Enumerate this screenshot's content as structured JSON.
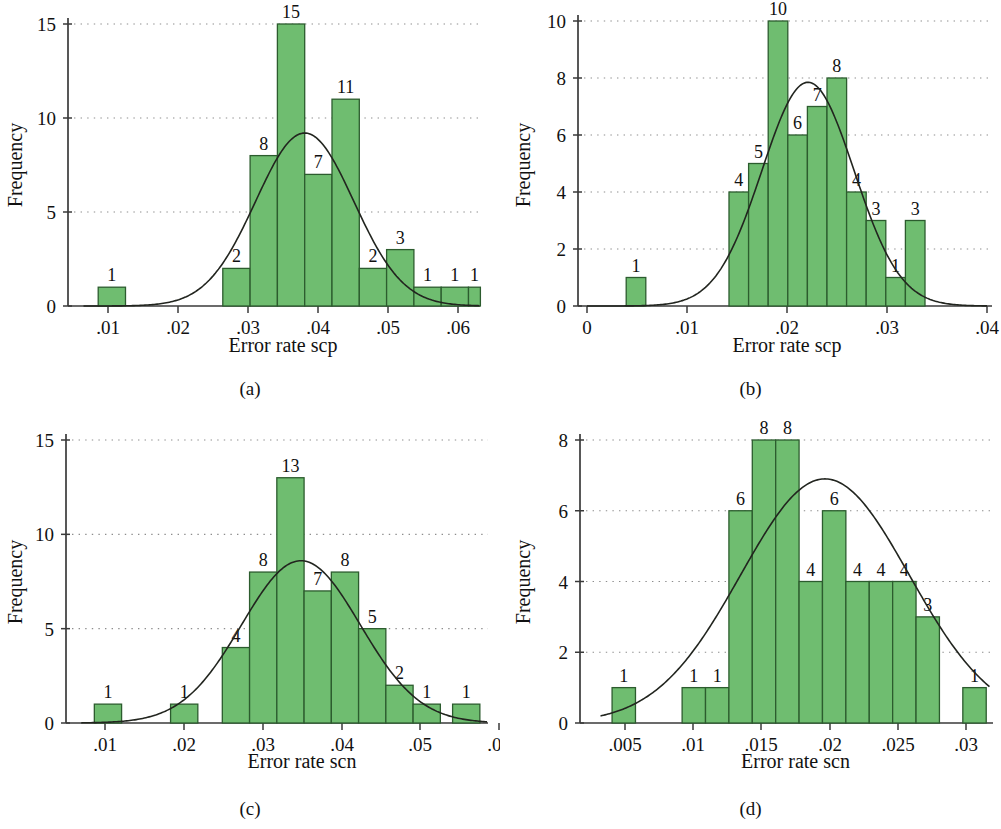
{
  "figure": {
    "panels": [
      {
        "id": "a",
        "caption": "(a)",
        "chart_data": {
          "type": "bar",
          "title": "",
          "xlabel": "Error rate scp",
          "ylabel": "Frequency",
          "xlim": [
            0.0065,
            0.0635
          ],
          "ylim": [
            0,
            16
          ],
          "xticks": [
            0.01,
            0.02,
            0.03,
            0.04,
            0.05,
            0.06
          ],
          "xticklabels": [
            ".01",
            ".02",
            ".03",
            ".04",
            ".05",
            ".06"
          ],
          "yticks": [
            0,
            5,
            10,
            15
          ],
          "yticklabels": [
            "0",
            "5",
            "10",
            "15"
          ],
          "grid": "horizontal-dotted",
          "bin_width": 0.0039,
          "bin_starts": [
            0.0086,
            0.0264,
            0.0303,
            0.0342,
            0.0381,
            0.042,
            0.0459,
            0.0498,
            0.0537,
            0.0576
          ],
          "values": [
            1,
            2,
            8,
            15,
            7,
            11,
            2,
            3,
            1,
            1,
            1
          ],
          "bars": [
            {
              "start": 0.0086,
              "end": 0.0125,
              "value": 1,
              "label": "1"
            },
            {
              "start": 0.0264,
              "end": 0.0303,
              "value": 2,
              "label": "2"
            },
            {
              "start": 0.0303,
              "end": 0.0342,
              "value": 8,
              "label": "8"
            },
            {
              "start": 0.0342,
              "end": 0.0381,
              "value": 15,
              "label": "15"
            },
            {
              "start": 0.0381,
              "end": 0.042,
              "value": 7,
              "label": "7"
            },
            {
              "start": 0.042,
              "end": 0.0459,
              "value": 11,
              "label": "11"
            },
            {
              "start": 0.0459,
              "end": 0.0498,
              "value": 2,
              "label": "2"
            },
            {
              "start": 0.0498,
              "end": 0.0537,
              "value": 3,
              "label": "3"
            },
            {
              "start": 0.0537,
              "end": 0.0576,
              "value": 1,
              "label": "1"
            },
            {
              "start": 0.0576,
              "end": 0.0615,
              "value": 1,
              "label": "1"
            },
            {
              "start": 0.0615,
              "end": 0.0632,
              "value": 1,
              "label": "1"
            }
          ],
          "normal_curve": {
            "mean": 0.0381,
            "sd": 0.007,
            "peak_height": 9.2
          }
        }
      },
      {
        "id": "b",
        "caption": "(b)",
        "chart_data": {
          "type": "bar",
          "title": "",
          "xlabel": "Error rate scp",
          "ylabel": "Frequency",
          "xlim": [
            0.0,
            0.04
          ],
          "ylim": [
            0,
            10.6
          ],
          "xticks": [
            0,
            0.01,
            0.02,
            0.03,
            0.04
          ],
          "xticklabels": [
            "0",
            ".01",
            ".02",
            ".03",
            ".04"
          ],
          "yticks": [
            0,
            2,
            4,
            6,
            8,
            10
          ],
          "yticklabels": [
            "0",
            "2",
            "4",
            "6",
            "8",
            "10"
          ],
          "grid": "horizontal-dotted",
          "bin_width": 0.00196,
          "values": [
            1,
            4,
            5,
            10,
            6,
            7,
            8,
            4,
            3,
            1,
            3
          ],
          "bars": [
            {
              "start": 0.00392,
              "end": 0.00588,
              "value": 1,
              "label": "1"
            },
            {
              "start": 0.0142,
              "end": 0.01616,
              "value": 4,
              "label": "4"
            },
            {
              "start": 0.01616,
              "end": 0.01812,
              "value": 5,
              "label": "5"
            },
            {
              "start": 0.01812,
              "end": 0.02008,
              "value": 10,
              "label": "10"
            },
            {
              "start": 0.02008,
              "end": 0.02204,
              "value": 6,
              "label": "6"
            },
            {
              "start": 0.02204,
              "end": 0.024,
              "value": 7,
              "label": "7"
            },
            {
              "start": 0.024,
              "end": 0.02596,
              "value": 8,
              "label": "8"
            },
            {
              "start": 0.02596,
              "end": 0.02792,
              "value": 4,
              "label": "4"
            },
            {
              "start": 0.02792,
              "end": 0.02988,
              "value": 3,
              "label": "3"
            },
            {
              "start": 0.02988,
              "end": 0.03184,
              "value": 1,
              "label": "1"
            },
            {
              "start": 0.03184,
              "end": 0.0338,
              "value": 3,
              "label": "3"
            }
          ],
          "normal_curve": {
            "mean": 0.0221,
            "sd": 0.0046,
            "peak_height": 7.85
          }
        }
      },
      {
        "id": "c",
        "caption": "(c)",
        "chart_data": {
          "type": "bar",
          "title": "",
          "xlabel": "Error rate scn",
          "ylabel": "Frequency",
          "xlim": [
            0.007,
            0.0602
          ],
          "ylim": [
            0,
            16
          ],
          "xticks": [
            0.01,
            0.02,
            0.03,
            0.04,
            0.05,
            0.06
          ],
          "xticklabels": [
            ".01",
            ".02",
            ".03",
            ".04",
            ".05",
            ".06"
          ],
          "yticks": [
            0,
            5,
            10,
            15
          ],
          "yticklabels": [
            "0",
            "5",
            "10",
            "15"
          ],
          "grid": "horizontal-dotted",
          "bin_width": 0.00345,
          "values": [
            1,
            1,
            4,
            8,
            13,
            7,
            8,
            5,
            2,
            1,
            1
          ],
          "bars": [
            {
              "start": 0.00865,
              "end": 0.0121,
              "value": 1,
              "label": "1"
            },
            {
              "start": 0.0183,
              "end": 0.02175,
              "value": 1,
              "label": "1"
            },
            {
              "start": 0.02485,
              "end": 0.0283,
              "value": 4,
              "label": "4"
            },
            {
              "start": 0.0283,
              "end": 0.03175,
              "value": 8,
              "label": "8"
            },
            {
              "start": 0.03175,
              "end": 0.0352,
              "value": 13,
              "label": "13"
            },
            {
              "start": 0.0352,
              "end": 0.03865,
              "value": 7,
              "label": "7"
            },
            {
              "start": 0.03865,
              "end": 0.0421,
              "value": 8,
              "label": "8"
            },
            {
              "start": 0.0421,
              "end": 0.04555,
              "value": 5,
              "label": "5"
            },
            {
              "start": 0.04555,
              "end": 0.049,
              "value": 2,
              "label": "2"
            },
            {
              "start": 0.049,
              "end": 0.05245,
              "value": 1,
              "label": "1"
            },
            {
              "start": 0.054,
              "end": 0.05745,
              "value": 1,
              "label": "1"
            }
          ],
          "normal_curve": {
            "mean": 0.0348,
            "sd": 0.0075,
            "peak_height": 8.6
          }
        }
      },
      {
        "id": "d",
        "caption": "(d)",
        "chart_data": {
          "type": "bar",
          "title": "",
          "xlabel": "Error rate scn",
          "ylabel": "Frequency",
          "xlim": [
            0.0032,
            0.0318
          ],
          "ylim": [
            0,
            8.6
          ],
          "xticks": [
            0.005,
            0.01,
            0.015,
            0.02,
            0.025,
            0.03
          ],
          "xticklabels": [
            ".005",
            ".01",
            ".015",
            ".02",
            ".025",
            ".03"
          ],
          "yticks": [
            0,
            2,
            4,
            6,
            8
          ],
          "yticklabels": [
            "0",
            "2",
            "4",
            "6",
            "8"
          ],
          "grid": "horizontal-dotted",
          "bin_width": 0.00172,
          "values": [
            1,
            1,
            1,
            6,
            8,
            8,
            4,
            6,
            4,
            4,
            4,
            3,
            1
          ],
          "bars": [
            {
              "start": 0.00405,
              "end": 0.00577,
              "value": 1,
              "label": "1"
            },
            {
              "start": 0.0092,
              "end": 0.01092,
              "value": 1,
              "label": "1"
            },
            {
              "start": 0.01092,
              "end": 0.01264,
              "value": 1,
              "label": "1"
            },
            {
              "start": 0.01264,
              "end": 0.01436,
              "value": 6,
              "label": "6"
            },
            {
              "start": 0.01436,
              "end": 0.01608,
              "value": 8,
              "label": "8"
            },
            {
              "start": 0.01608,
              "end": 0.0178,
              "value": 8,
              "label": "8"
            },
            {
              "start": 0.0178,
              "end": 0.01952,
              "value": 4,
              "label": "4"
            },
            {
              "start": 0.01952,
              "end": 0.02124,
              "value": 6,
              "label": "6"
            },
            {
              "start": 0.02124,
              "end": 0.02296,
              "value": 4,
              "label": "4"
            },
            {
              "start": 0.02296,
              "end": 0.02468,
              "value": 4,
              "label": "4"
            },
            {
              "start": 0.02468,
              "end": 0.0264,
              "value": 4,
              "label": "4"
            },
            {
              "start": 0.0264,
              "end": 0.02812,
              "value": 3,
              "label": "3"
            },
            {
              "start": 0.02984,
              "end": 0.03156,
              "value": 1,
              "label": "1"
            }
          ],
          "normal_curve": {
            "mean": 0.0197,
            "sd": 0.0062,
            "peak_height": 6.9
          }
        }
      }
    ],
    "colors": {
      "bar_fill": "#6fbd70",
      "bar_stroke": "#2c5c2e",
      "curve": "#22251f",
      "axis": "#3a3a3a",
      "grid": "#8d8d8d",
      "text": "#111111",
      "background": "#ffffff"
    }
  }
}
